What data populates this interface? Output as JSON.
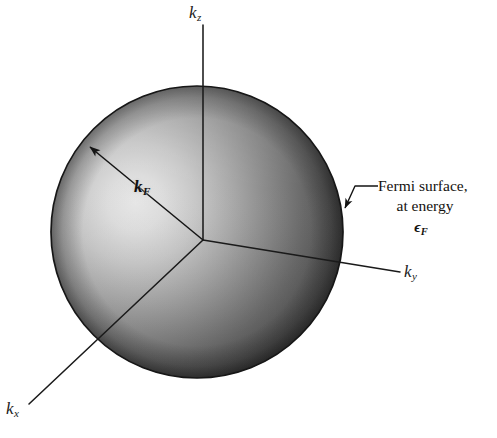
{
  "figure": {
    "background_color": "#ffffff",
    "line_color": "#1a1a1a"
  },
  "sphere": {
    "name": "fermi-sphere",
    "center_x": 197,
    "center_y": 232,
    "radius": 146,
    "highlight_x": 120,
    "highlight_y": 208,
    "highlight_color": "#dedede",
    "mid_color": "#8a8a8a",
    "edge_color": "#3b3b3b",
    "outline_color": "#171717"
  },
  "axes": [
    {
      "name": "k-z-axis",
      "label": "k",
      "sub": "z",
      "x1": 203,
      "y1": 240,
      "x2": 203,
      "y2": 25
    },
    {
      "name": "k-y-axis",
      "label": "k",
      "sub": "y",
      "x1": 203,
      "y1": 240,
      "x2": 400,
      "y2": 272
    },
    {
      "name": "k-x-axis",
      "label": "k",
      "sub": "x",
      "x1": 203,
      "y1": 240,
      "x2": 29,
      "y2": 404
    }
  ],
  "radius_marker": {
    "name": "k-F-radius",
    "label": "k",
    "sub": "F",
    "x1": 203,
    "y1": 240,
    "x2": 86,
    "y2": 144
  },
  "annotation": {
    "name": "fermi-surface-callout",
    "line1": "Fermi surface,",
    "line2": "at energy",
    "line3_symbol": "ϵ",
    "line3_sub": "F",
    "leader": {
      "x1": 376,
      "y1": 186,
      "x2": 355,
      "y2": 186,
      "x3": 342,
      "y3": 211
    }
  }
}
